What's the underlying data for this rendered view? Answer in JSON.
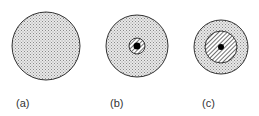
{
  "figure": {
    "panels": [
      {
        "id": "a",
        "label": "(a)",
        "cx": 46,
        "cy": 46,
        "outer_r": 34,
        "hatched_r": null,
        "core_r": null,
        "label_x": 16,
        "label_y": 97
      },
      {
        "id": "b",
        "label": "(b)",
        "cx": 137,
        "cy": 46,
        "outer_r": 31,
        "hatched_r": 8,
        "core_r": 3.5,
        "label_x": 110,
        "label_y": 97
      },
      {
        "id": "c",
        "label": "(c)",
        "cx": 221,
        "cy": 47,
        "outer_r": 27,
        "hatched_r": 16,
        "core_r": 3,
        "label_x": 202,
        "label_y": 97
      }
    ],
    "colors": {
      "stipple_bg": "#e6e6e6",
      "stipple_dot": "#8a8a8a",
      "outline": "#333333",
      "hatch": "#333333",
      "core": "#000000"
    }
  }
}
